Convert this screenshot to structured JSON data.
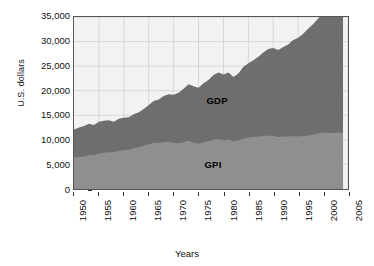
{
  "chart_data": {
    "type": "area",
    "stacked": true,
    "title": "",
    "xlabel": "Years",
    "ylabel": "U.S. dollars",
    "xlim": [
      1950,
      2005
    ],
    "ylim": [
      0,
      35000
    ],
    "grid": true,
    "legend_position": "inline-annotation",
    "ytick_labels": [
      "35,000",
      "30,000",
      "25,000",
      "20,000",
      "15,000",
      "10,000",
      "5,000",
      "0"
    ],
    "ytick_values": [
      35000,
      30000,
      25000,
      20000,
      15000,
      10000,
      5000,
      0
    ],
    "xtick_labels": [
      "1950",
      "1955",
      "1960",
      "1965",
      "1970",
      "1975",
      "1980",
      "1985",
      "1990",
      "1995",
      "2000",
      "2005"
    ],
    "xtick_values": [
      1950,
      1955,
      1960,
      1965,
      1970,
      1975,
      1980,
      1985,
      1990,
      1995,
      2000,
      2005
    ],
    "annotations": [
      {
        "text": "GDP",
        "x": 1979,
        "y": 18000
      },
      {
        "text": "GPI",
        "x": 1978,
        "y": 5000
      }
    ],
    "colors": {
      "GDP": "#6e6e6e",
      "GPI": "#8f8f8f",
      "plot_background": "#f2f2f2",
      "grid": "#d0d0d0",
      "axis": "#555555",
      "text": "#111111"
    },
    "x": [
      1950,
      1951,
      1952,
      1953,
      1954,
      1955,
      1956,
      1957,
      1958,
      1959,
      1960,
      1961,
      1962,
      1963,
      1964,
      1965,
      1966,
      1967,
      1968,
      1969,
      1970,
      1971,
      1972,
      1973,
      1974,
      1975,
      1976,
      1977,
      1978,
      1979,
      1980,
      1981,
      1982,
      1983,
      1984,
      1985,
      1986,
      1987,
      1988,
      1989,
      1990,
      1991,
      1992,
      1993,
      1994,
      1995,
      1996,
      1997,
      1998,
      1999,
      2000,
      2001,
      2002,
      2003,
      2004
    ],
    "series": [
      {
        "name": "GDP",
        "values": [
          12100,
          12500,
          12800,
          13300,
          13000,
          13700,
          13900,
          14000,
          13700,
          14300,
          14500,
          14600,
          15200,
          15600,
          16300,
          17100,
          17900,
          18200,
          18900,
          19300,
          19200,
          19600,
          20400,
          21300,
          20900,
          20600,
          21500,
          22200,
          23200,
          23700,
          23300,
          23700,
          22800,
          23500,
          24900,
          25600,
          26200,
          26900,
          27800,
          28500,
          28700,
          28300,
          28900,
          29400,
          30300,
          30800,
          31600,
          32600,
          33600,
          34700,
          35700,
          35700,
          35900,
          36200,
          36000
        ],
        "ylabel_units": "U.S. dollars per capita"
      },
      {
        "name": "GPI",
        "values": [
          6400,
          6500,
          6600,
          6900,
          6900,
          7200,
          7400,
          7500,
          7500,
          7800,
          7900,
          8000,
          8300,
          8500,
          8800,
          9100,
          9400,
          9400,
          9500,
          9600,
          9400,
          9300,
          9500,
          9800,
          9400,
          9200,
          9500,
          9700,
          10000,
          10100,
          9900,
          10000,
          9700,
          9900,
          10300,
          10500,
          10600,
          10700,
          10800,
          10900,
          10800,
          10600,
          10700,
          10700,
          10800,
          10700,
          10800,
          10900,
          11100,
          11300,
          11500,
          11400,
          11400,
          11500,
          11400
        ],
        "ylabel_units": "U.S. dollars per capita"
      }
    ]
  },
  "figure": {
    "ylabel": "U.S. dollars",
    "xlabel": "Years"
  }
}
